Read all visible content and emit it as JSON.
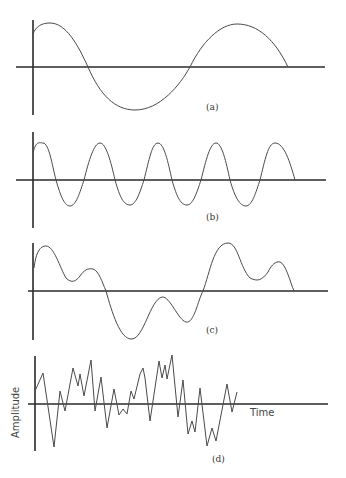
{
  "figure": {
    "panels": [
      {
        "id": "a",
        "label": "(a)",
        "description": "Low-frequency sine wave"
      },
      {
        "id": "b",
        "label": "(b)",
        "description": "Higher-frequency sine wave"
      },
      {
        "id": "c",
        "label": "(c)",
        "description": "Sum of sine waves (complex periodic)"
      },
      {
        "id": "d",
        "label": "(d)",
        "description": "Random / noise-like waveform"
      }
    ],
    "axis_labels": {
      "y": "Amplitude",
      "x": "Time"
    }
  }
}
